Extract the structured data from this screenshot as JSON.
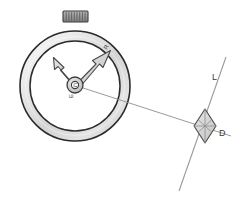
{
  "figure": {
    "background_color": "#ffffff",
    "width": 233,
    "height": 203
  },
  "colors": {
    "ring_outline": "#2b2b2b",
    "ring_fill_light": "#f2f2f2",
    "ring_fill_mid": "#d8d8d8",
    "ring_fill_dark": "#bdbdbd",
    "dial_fill": "#ffffff",
    "crown_fill": "#9a9a9a",
    "crown_outline": "#3a3a3a",
    "crown_rib": "#5c5c5c",
    "arrow_fill": "#d0d0d0",
    "arrow_outline": "#4a4a4a",
    "hub_fill": "#c9c9c9",
    "hub_outline": "#3d3d3d",
    "line_stroke": "#8f8f8f",
    "diamond_fill": "#d6d6d6",
    "diamond_outline": "#4a4a4a",
    "label_color": "#3a3a3a"
  },
  "stopwatch": {
    "name": "stopwatch-body",
    "center": {
      "x": 75,
      "y": 86
    },
    "outer_radius": 55,
    "ring_inner_radius": 45,
    "crown": {
      "label": "crown-button",
      "x": 63,
      "y": 11,
      "width": 25,
      "height": 11,
      "rib_count": 9
    },
    "hub": {
      "label": "C",
      "outer_radius": 8,
      "inner_radius": 4
    }
  },
  "arrows": [
    {
      "name": "arrow-upper-left",
      "label": "",
      "from": {
        "x": 75,
        "y": 82
      },
      "to": {
        "x": 54,
        "y": 58
      },
      "shaft_width": 5,
      "head_width": 11,
      "head_length": 10
    },
    {
      "name": "arrow-upper-right",
      "label": "R",
      "from": {
        "x": 75,
        "y": 82
      },
      "to": {
        "x": 110,
        "y": 50
      },
      "shaft_width": 5,
      "head_width": 11,
      "head_length": 11
    }
  ],
  "labels": {
    "hub_letter": "C",
    "hub_sub_letter": "E",
    "arrow_right_letter": "R",
    "line_letter": "L",
    "diamond_letter": "D"
  },
  "line_L": {
    "name": "line-L",
    "start": {
      "x": 226,
      "y": 57
    },
    "end": {
      "x": 179,
      "y": 191
    },
    "label": "L",
    "label_pos": {
      "x": 214,
      "y": 78
    }
  },
  "ray_from_center": {
    "name": "ray-center-to-diamond",
    "start": {
      "x": 77,
      "y": 86
    },
    "end": {
      "x": 230,
      "y": 135
    }
  },
  "diamond": {
    "name": "diamond-D",
    "label": "D",
    "center": {
      "x": 205,
      "y": 126
    },
    "half_width": 11,
    "half_height": 17,
    "label_pos": {
      "x": 218,
      "y": 134
    }
  }
}
